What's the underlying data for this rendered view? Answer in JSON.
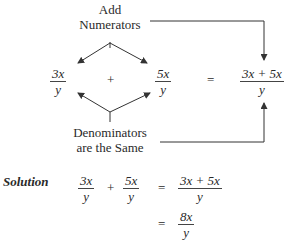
{
  "diagram": {
    "top_label": [
      "Add",
      "Numerators"
    ],
    "bottom_label": [
      "Denominators",
      "are the Same"
    ],
    "left_fraction": {
      "num": "3x",
      "den": "y"
    },
    "right_fraction": {
      "num": "5x",
      "den": "y"
    },
    "result_fraction": {
      "num": "3x + 5x",
      "den": "y"
    },
    "plus": "+",
    "equals": "="
  },
  "solution": {
    "label": "Solution",
    "line1": {
      "f1": {
        "num": "3x",
        "den": "y"
      },
      "plus": "+",
      "f2": {
        "num": "5x",
        "den": "y"
      },
      "equals": "=",
      "result": {
        "num": "3x + 5x",
        "den": "y"
      }
    },
    "line2": {
      "equals": "=",
      "result": {
        "num": "8x",
        "den": "y"
      }
    }
  },
  "colors": {
    "line": "#3a3a3a",
    "text": "#2a2a2a"
  }
}
